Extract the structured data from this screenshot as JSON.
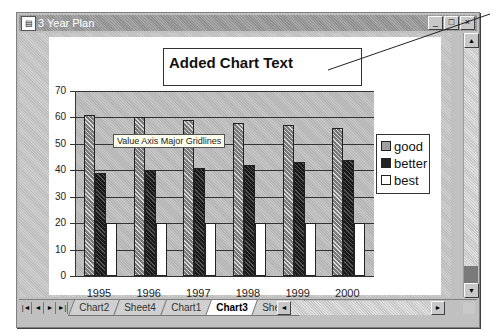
{
  "window": {
    "title": "3 Year Plan",
    "buttons": {
      "minimize": "_",
      "maximize": "□",
      "close": "×"
    }
  },
  "chart": {
    "added_text": "Added Chart Text",
    "tooltip": "Value Axis Major Gridlines"
  },
  "sheet_tabs": [
    {
      "label": "Chart2",
      "active": false
    },
    {
      "label": "Sheet4",
      "active": false
    },
    {
      "label": "Chart1",
      "active": false
    },
    {
      "label": "Chart3",
      "active": true
    },
    {
      "label": "Sheet3",
      "active": false
    }
  ],
  "nav_buttons": [
    "|◄",
    "◄",
    "►",
    "►|"
  ],
  "chart_data": {
    "type": "bar",
    "title": "Added Chart Text",
    "categories": [
      "1995",
      "1996",
      "1997",
      "1998",
      "1999",
      "2000"
    ],
    "series": [
      {
        "name": "good",
        "values": [
          61,
          60,
          59,
          58,
          57,
          56
        ],
        "pattern": "crosshatch-light"
      },
      {
        "name": "better",
        "values": [
          39,
          40,
          41,
          42,
          43,
          44
        ],
        "pattern": "dark"
      },
      {
        "name": "best",
        "values": [
          20,
          20,
          20,
          20,
          20,
          20
        ],
        "pattern": "white"
      }
    ],
    "xlabel": "",
    "ylabel": "",
    "ylim": [
      0,
      70
    ],
    "yticks": [
      0,
      10,
      20,
      30,
      40,
      50,
      60,
      70
    ],
    "grid": true,
    "legend_position": "right",
    "annotations": [
      "Value Axis Major Gridlines"
    ]
  }
}
